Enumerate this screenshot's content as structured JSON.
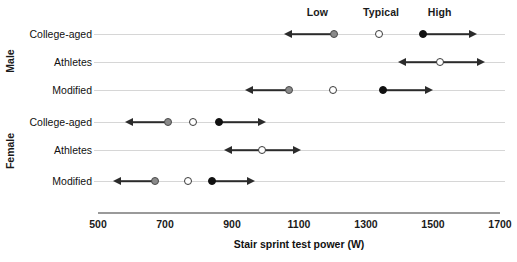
{
  "chart_data": {
    "type": "scatter",
    "title": "",
    "xlabel": "Stair sprint test power (W)",
    "ylabel": "",
    "xlim": [
      500,
      1700
    ],
    "xticks": [
      500,
      700,
      900,
      1100,
      1300,
      1500,
      1700
    ],
    "xticklabels": [
      "500",
      "700",
      "900",
      "1100",
      "1300",
      "1500",
      "1700"
    ],
    "grid": false,
    "legend_position": "top",
    "column_headers": [
      {
        "label": "Low",
        "x": 1155,
        "color": "#8a8a8a"
      },
      {
        "label": "Typical",
        "x": 1345,
        "color": "#ffffff"
      },
      {
        "label": "High",
        "x": 1520,
        "color": "#111111"
      }
    ],
    "series": [
      {
        "name": "Low",
        "marker": "filled-gray",
        "color": "#8a8a8a",
        "arrow": "left"
      },
      {
        "name": "Typical",
        "marker": "open",
        "color": "#ffffff",
        "arrow": "none"
      },
      {
        "name": "High",
        "marker": "filled-black",
        "color": "#111111",
        "arrow": "right"
      }
    ],
    "groups": [
      {
        "label": "Male",
        "rows": [
          {
            "label": "College-aged",
            "low": 1205,
            "low_arrow_to": 1055,
            "typical": 1340,
            "high": 1470,
            "high_arrow_to": 1630
          },
          {
            "label": "Athletes",
            "low": null,
            "low_arrow_to": null,
            "typical": 1520,
            "typical_arrow_from": 1395,
            "typical_arrow_to": 1655,
            "high": null,
            "high_arrow_to": null
          },
          {
            "label": "Modified",
            "low": 1070,
            "low_arrow_to": 940,
            "typical": 1200,
            "high": 1350,
            "high_arrow_to": 1500
          }
        ]
      },
      {
        "label": "Female",
        "rows": [
          {
            "label": "College-aged",
            "low": 710,
            "low_arrow_to": 580,
            "typical": 785,
            "high": 860,
            "high_arrow_to": 1000
          },
          {
            "label": "Athletes",
            "low": null,
            "low_arrow_to": null,
            "typical": 990,
            "typical_arrow_from": 875,
            "typical_arrow_to": 1105,
            "high": null,
            "high_arrow_to": null
          },
          {
            "label": "Modified",
            "low": 670,
            "low_arrow_to": 545,
            "typical": 770,
            "high": 840,
            "high_arrow_to": 970
          }
        ]
      }
    ]
  }
}
